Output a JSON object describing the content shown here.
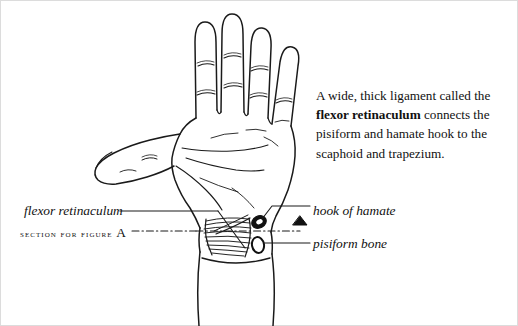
{
  "figure": {
    "caption": {
      "line1": "A wide, thick ligament called the",
      "bold_term": "flexor retinaculum",
      "line2_rest": " connects the",
      "line3": "pisiform and hamate hook to the",
      "line4": "scaphoid and trapezium."
    },
    "labels": {
      "flexor_retinaculum": "flexor retinaculum",
      "section_for_figure": "section for figure ",
      "section_figure_letter": "A",
      "hook_of_hamate": "hook of hamate",
      "pisiform_bone": "pisiform bone"
    },
    "colors": {
      "ink": "#111111",
      "line": "#1a1a1a",
      "background": "#ffffff",
      "frame": "#dcdcdc"
    },
    "illustration": {
      "subject": "palmar view of left hand and wrist",
      "marker": "section-plane-triangle",
      "structures": [
        "flexor retinaculum fibrous band",
        "hook of hamate",
        "pisiform bone",
        "forearm"
      ]
    }
  }
}
